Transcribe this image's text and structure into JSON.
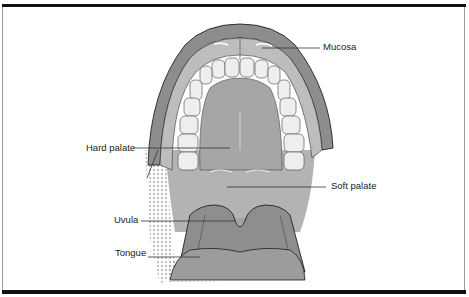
{
  "figure": {
    "type": "anatomical illustration",
    "labels": [
      {
        "id": "mucosa",
        "text": "Mucosa"
      },
      {
        "id": "hard_palate",
        "text": "Hard palate"
      },
      {
        "id": "soft_palate",
        "text": "Soft palate"
      },
      {
        "id": "uvula",
        "text": "Uvula"
      },
      {
        "id": "tongue",
        "text": "Tongue"
      }
    ],
    "colors": {
      "outer_gum": "#8c8c8c",
      "mucosa": "#b9b9b9",
      "palate": "#a9a9a9",
      "teeth": "#ececec",
      "tongue": "#9a9a9a",
      "frame": "#111111"
    }
  }
}
